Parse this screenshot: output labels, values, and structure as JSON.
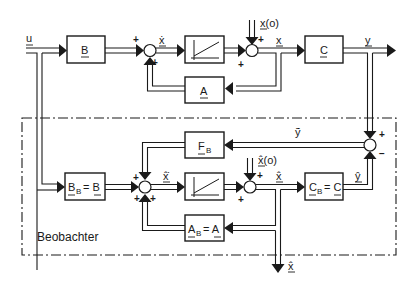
{
  "caption": "Beobachter",
  "signals": {
    "u": "u",
    "x_dot": "ẋ",
    "x": "x",
    "x0": "x(o)",
    "y": "y",
    "y_tilde": "ỹ",
    "x_hat_dot": "x̂̇",
    "x_hat": "x̂",
    "x_hat0": "x̂(o)",
    "y_hat": "ŷ",
    "x_hat_out": "x̂"
  },
  "blocks": {
    "B": {
      "main": "B",
      "sub": ""
    },
    "C": {
      "main": "C",
      "sub": ""
    },
    "A": {
      "main": "A",
      "sub": ""
    },
    "integrator_plant": {
      "icon": "ramp-integrator-icon"
    },
    "F_B": {
      "main": "F",
      "sub": "B"
    },
    "B_B": {
      "main": "B",
      "sub": "B",
      "eq": "= B"
    },
    "integrator_observer": {
      "icon": "ramp-integrator-icon"
    },
    "C_B": {
      "main": "C",
      "sub": "B",
      "eq": "= C"
    },
    "A_B": {
      "main": "A",
      "sub": "B",
      "eq": "= A"
    }
  },
  "signs": {
    "plus": "+",
    "minus": "−"
  },
  "colors": {
    "ink": "#1a1a1a",
    "background": "#ffffff"
  }
}
